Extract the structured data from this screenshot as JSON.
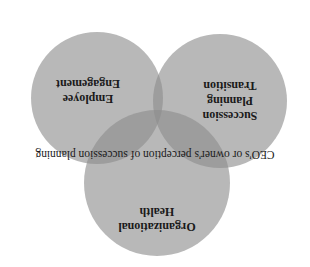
{
  "diagram": {
    "type": "venn",
    "orientation": "rotated-180",
    "circles": [
      {
        "id": "succession",
        "lines": [
          "Succession",
          "Planning",
          "Transition"
        ]
      },
      {
        "id": "engagement",
        "lines": [
          "Employee",
          "Engagement"
        ]
      },
      {
        "id": "health",
        "lines": [
          "Organizational",
          "Health"
        ]
      }
    ],
    "center_caption": "CEO's or owner's perception of succession planning",
    "colors": {
      "circle_fill": "#9a9a9a",
      "text": "#1a1a1a",
      "background": "#ffffff"
    }
  }
}
